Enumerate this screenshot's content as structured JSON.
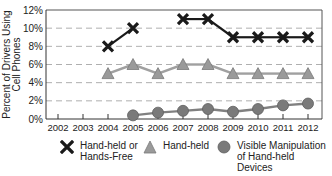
{
  "chart_data": {
    "type": "line",
    "title": "",
    "xlabel": "",
    "ylabel": "Percent of Drivers Using Cell Phones",
    "ylabel_lines": [
      "Percent of Drivers Using",
      "Cell Phones"
    ],
    "ylim": [
      0,
      12
    ],
    "yticks": [
      0,
      2,
      4,
      6,
      8,
      10,
      12
    ],
    "ytick_labels": [
      "0%",
      "2%",
      "4%",
      "6%",
      "8%",
      "10%",
      "12%"
    ],
    "categories": [
      "2002",
      "2003",
      "2004",
      "2005",
      "2006",
      "2007",
      "2008",
      "2009",
      "2010",
      "2011",
      "2012"
    ],
    "grid": "horizontal dashed",
    "legend_position": "bottom",
    "series": [
      {
        "name": "Hand-held or Hands-Free",
        "marker": "x",
        "color": "#1a1a1a",
        "values": [
          null,
          null,
          8,
          10,
          null,
          11,
          11,
          9,
          9,
          9,
          9
        ]
      },
      {
        "name": "Hand-held",
        "marker": "triangle",
        "color": "#8c8c8c",
        "values": [
          null,
          null,
          5,
          6,
          5,
          6,
          6,
          5,
          5,
          5,
          5
        ]
      },
      {
        "name": "Visible Manipulation of Hand-held Devices",
        "marker": "circle",
        "color": "#707070",
        "values": [
          null,
          null,
          null,
          0.4,
          0.7,
          0.9,
          1.1,
          0.8,
          1.1,
          1.5,
          1.7
        ]
      }
    ]
  },
  "legend": {
    "items": [
      {
        "label": "Hand-held or\nHands-Free"
      },
      {
        "label": "Hand-held"
      },
      {
        "label": "Visible Manipulation\nof Hand-held Devices"
      }
    ]
  }
}
